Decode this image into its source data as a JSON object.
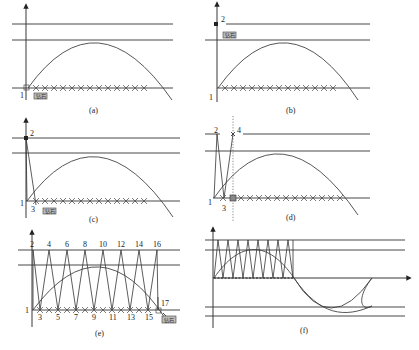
{
  "figure": {
    "panels": [
      {
        "id": "a",
        "caption": "(a)",
        "point_labels": [
          "1"
        ],
        "tag": "钻石",
        "crosses": 13
      },
      {
        "id": "b",
        "caption": "(b)",
        "point_labels": [
          "1",
          "2"
        ],
        "tag": "钻石",
        "crosses": 13
      },
      {
        "id": "c",
        "caption": "(c)",
        "point_labels": [
          "1",
          "2",
          "3"
        ],
        "tag": "钻石",
        "crosses": 13
      },
      {
        "id": "d",
        "caption": "(d)",
        "point_labels": [
          "1",
          "2",
          "3",
          "4"
        ],
        "tag": "",
        "crosses": 13
      },
      {
        "id": "e",
        "caption": "(e)",
        "point_labels": [
          "1",
          "2",
          "3",
          "4",
          "5",
          "6",
          "7",
          "8",
          "9",
          "10",
          "11",
          "12",
          "13",
          "14",
          "15",
          "16",
          "17"
        ],
        "tag": "钻石",
        "crosses": 15
      },
      {
        "id": "f",
        "caption": "(f)",
        "point_labels": [],
        "tag": "",
        "crosses": 0
      }
    ],
    "labels": {
      "a": {
        "p1": "1",
        "cap": "(a)",
        "tag": "钻石"
      },
      "b": {
        "p1": "1",
        "p2": "2",
        "cap": "(b)",
        "tag": "钻石"
      },
      "c": {
        "p1": "1",
        "p2": "2",
        "p3": "3",
        "cap": "(c)",
        "tag": "钻石"
      },
      "d": {
        "p1": "1",
        "p2": "2",
        "p3": "3",
        "p4": "4",
        "cap": "(d)"
      },
      "e": {
        "top": [
          "2",
          "4",
          "6",
          "8",
          "10",
          "12",
          "14",
          "16"
        ],
        "bottom": [
          "3",
          "5",
          "7",
          "9",
          "11",
          "13",
          "15"
        ],
        "p1": "1",
        "p17": "17",
        "cap": "(e)",
        "tag": "钻石"
      },
      "f": {
        "cap": "(f)"
      }
    }
  }
}
